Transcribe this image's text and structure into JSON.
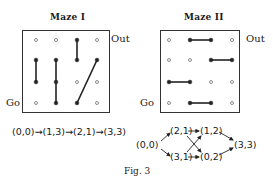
{
  "maze1": {
    "title": "Maze I",
    "out_label": "Out",
    "go_label": "Go",
    "grid": {
      "cols_x": [
        36,
        56,
        77,
        97
      ],
      "rows_y": [
        40,
        60,
        82,
        103
      ]
    },
    "walls": [
      {
        "from": [
          0,
          1
        ],
        "to": [
          0,
          2
        ]
      },
      {
        "from": [
          1,
          1
        ],
        "to": [
          1,
          3
        ]
      },
      {
        "from": [
          2,
          0
        ],
        "to": [
          2,
          1
        ]
      },
      {
        "from": [
          2,
          3
        ],
        "to": [
          3,
          1
        ]
      }
    ],
    "path_text": "(0,0)→(1,3)→(2,1)→(3,3)"
  },
  "maze2": {
    "title": "Maze II",
    "out_label": "Out",
    "go_label": "Go",
    "grid": {
      "cols_x": [
        169,
        190,
        211,
        232
      ],
      "rows_y": [
        40,
        60,
        82,
        103
      ]
    },
    "walls": [
      {
        "from": [
          1,
          0
        ],
        "to": [
          2,
          0
        ]
      },
      {
        "from": [
          2,
          1
        ],
        "to": [
          3,
          1
        ]
      },
      {
        "from": [
          0,
          2
        ],
        "to": [
          1,
          2
        ]
      },
      {
        "from": [
          1,
          3
        ],
        "to": [
          2,
          3
        ]
      }
    ],
    "graph": {
      "nodes": {
        "start": "(0,0)",
        "top1": "(2,1)",
        "top2": "(1,2)",
        "bot1": "(3,1)",
        "bot2": "(0,2)",
        "end": "(3,3)"
      },
      "edges": [
        [
          "(0,0)",
          "(2,1)"
        ],
        [
          "(0,0)",
          "(3,1)"
        ],
        [
          "(2,1)",
          "(1,2)"
        ],
        [
          "(2,1)",
          "(0,2)"
        ],
        [
          "(3,1)",
          "(0,2)"
        ],
        [
          "(3,1)",
          "(1,2)"
        ],
        [
          "(1,2)",
          "(3,3)"
        ],
        [
          "(0,2)",
          "(3,3)"
        ]
      ]
    }
  },
  "caption": "Fig. 3"
}
